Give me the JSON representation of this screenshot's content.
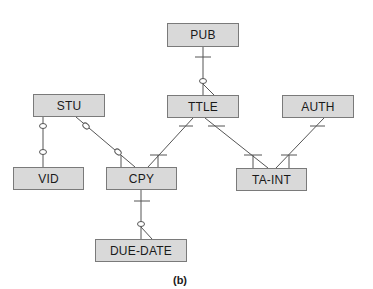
{
  "diagram": {
    "type": "entity-relationship",
    "caption": "(b)",
    "entities": [
      {
        "id": "pub",
        "label": "PUB"
      },
      {
        "id": "stu",
        "label": "STU"
      },
      {
        "id": "ttle",
        "label": "TTLE"
      },
      {
        "id": "auth",
        "label": "AUTH"
      },
      {
        "id": "vid",
        "label": "VID"
      },
      {
        "id": "cpy",
        "label": "CPY"
      },
      {
        "id": "ta_int",
        "label": "TA-INT"
      },
      {
        "id": "due_date",
        "label": "DUE-DATE"
      }
    ],
    "relationships": [
      {
        "from": "PUB",
        "to": "TTLE",
        "from_end": "one (bar)",
        "to_end": "zero-or-many (circle + crow's foot)"
      },
      {
        "from": "STU",
        "to": "VID",
        "from_end": "zero (circle)",
        "to_end": "zero (circle)"
      },
      {
        "from": "STU",
        "to": "CPY",
        "from_end": "zero (circle)",
        "to_end": "zero-or-many (circle + crow's foot)"
      },
      {
        "from": "TTLE",
        "to": "CPY",
        "from_end": "one (bar)",
        "to_end": "one-or-many (bar + crow's foot)"
      },
      {
        "from": "TTLE",
        "to": "TA-INT",
        "from_end": "one (bar)",
        "to_end": "one-or-many (bar + crow's foot)"
      },
      {
        "from": "AUTH",
        "to": "TA-INT",
        "from_end": "one (bar)",
        "to_end": "one-or-many (bar + crow's foot)"
      },
      {
        "from": "CPY",
        "to": "DUE-DATE",
        "from_end": "one (bar)",
        "to_end": "zero-or-many (circle + crow's foot)"
      }
    ]
  },
  "colors": {
    "entity_fill": "#d9d9d9",
    "entity_border": "#7a7a7a",
    "line": "#555555"
  }
}
